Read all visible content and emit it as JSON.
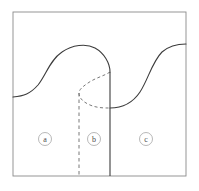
{
  "figure": {
    "frame": {
      "name": "outer-frame",
      "x": 13,
      "y": 12,
      "width": 173,
      "height": 164,
      "stroke_color": "#8a8a8a",
      "stroke_width": 0.9,
      "fill_color": "#ffffff"
    },
    "curves": [
      {
        "name": "left-solid-fold-curve",
        "style": "solid",
        "stroke_color": "#3c3c3c",
        "stroke_width": 1.1,
        "path": "M 13 97 C 24 96 30 94 38 85 C 46 75 50 60 62 52 C 72 45 86 43 95 48 C 104 53 110 63 110 72 L 110 176",
        "description": "S-curve entering at left border, peaking near top center, folding down into vertical line"
      },
      {
        "name": "center-dashed-fold-curve",
        "style": "dashed",
        "stroke_color": "#6a6a6a",
        "stroke_width": 0.9,
        "dash_pattern": "3,2.5",
        "path": "M 110 72 C 104 76 95 78 88 83 C 82 87 79 90 79 93 C 79 98 83 102 90 105 C 97 108 104 108 110 108",
        "description": "Hidden branch curving back left to a cusp then right to meet the vertical line"
      },
      {
        "name": "right-solid-curve",
        "style": "solid",
        "stroke_color": "#3c3c3c",
        "stroke_width": 1.1,
        "path": "M 110 108 C 122 108 132 104 140 92 C 148 80 152 62 162 52 C 170 45 179 44 186 44",
        "description": "S-curve leaving the vertical line horizontally and rising to the right border"
      }
    ],
    "boundaries": [
      {
        "name": "dashed-vertical-boundary",
        "style": "dashed",
        "stroke_color": "#6a6a6a",
        "stroke_width": 0.9,
        "dash_pattern": "3.5,3",
        "x": 79,
        "y_top": 93,
        "y_bottom": 176
      },
      {
        "name": "solid-vertical-boundary",
        "style": "solid",
        "stroke_color": "#3c3c3c",
        "stroke_width": 1.1,
        "x": 110,
        "y_top": 72,
        "y_bottom": 176
      }
    ],
    "region_labels": [
      {
        "name": "region-label-a",
        "label": "a",
        "cx": 45,
        "cy": 139,
        "r": 6.5
      },
      {
        "name": "region-label-b",
        "label": "b",
        "cx": 94,
        "cy": 139,
        "r": 6.5
      },
      {
        "name": "region-label-c",
        "label": "c",
        "cx": 146,
        "cy": 139,
        "r": 6.5
      }
    ]
  }
}
